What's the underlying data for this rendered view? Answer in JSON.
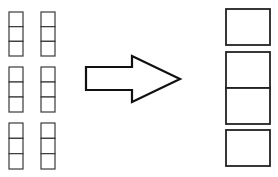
{
  "diagram": {
    "colors": {
      "stroke": "#222222",
      "background": "#ffffff"
    },
    "left_stacks": [
      {
        "x": 9,
        "y": 12,
        "w": 14,
        "h": 44,
        "cells": 3
      },
      {
        "x": 41,
        "y": 12,
        "w": 14,
        "h": 44,
        "cells": 3
      },
      {
        "x": 9,
        "y": 67,
        "w": 14,
        "h": 45,
        "cells": 3
      },
      {
        "x": 41,
        "y": 67,
        "w": 14,
        "h": 45,
        "cells": 3
      },
      {
        "x": 9,
        "y": 123,
        "w": 14,
        "h": 46,
        "cells": 3
      },
      {
        "x": 41,
        "y": 123,
        "w": 14,
        "h": 46,
        "cells": 3
      }
    ],
    "arrow": {
      "direction": "right",
      "icon": "arrow-right-icon"
    },
    "right_boxes": [
      {
        "x": 226,
        "y": 9,
        "w": 44,
        "h": 36,
        "cells": 1
      },
      {
        "x": 226,
        "y": 52,
        "w": 44,
        "h": 72,
        "cells": 2
      },
      {
        "x": 226,
        "y": 130,
        "w": 44,
        "h": 36,
        "cells": 1
      }
    ]
  }
}
